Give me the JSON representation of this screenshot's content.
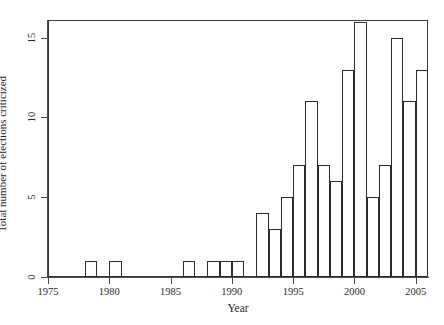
{
  "chart_data": {
    "type": "bar",
    "title": "",
    "xlabel": "Year",
    "ylabel": "Total number of elections criticized",
    "categories": [
      1978,
      1980,
      1986,
      1988,
      1989,
      1990,
      1992,
      1993,
      1994,
      1995,
      1996,
      1997,
      1998,
      1999,
      2000,
      2001,
      2002,
      2003,
      2004,
      2005
    ],
    "values": [
      1,
      1,
      1,
      1,
      1,
      1,
      4,
      3,
      5,
      7,
      11,
      7,
      6,
      13,
      16,
      5,
      7,
      15,
      11,
      13
    ],
    "xlim": [
      1975,
      2006
    ],
    "ylim": [
      0,
      16.1
    ],
    "xticks": [
      1975,
      1980,
      1985,
      1990,
      1995,
      2000,
      2005
    ],
    "xtick_labels": [
      "1975",
      "1980",
      "1985",
      "1990",
      "1995",
      "2000",
      "2005"
    ],
    "yticks": [
      0,
      5,
      10,
      15
    ],
    "ytick_labels": [
      "0",
      "5",
      "10",
      "15"
    ],
    "grid": false,
    "legend": null,
    "bar_fill": "#ffffff",
    "bar_edge": "#2b2b2b",
    "bin_width": 1,
    "note": "Histogram of criticized elections per year; bars are hollow with black outlines."
  }
}
